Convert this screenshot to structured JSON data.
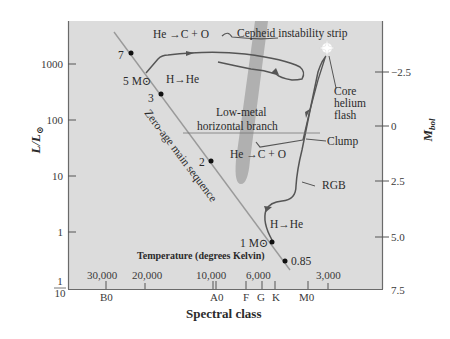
{
  "colors": {
    "plot_bg": "#dcdcdc",
    "frame": "#6a6a6a",
    "zams_line": "#9a9a9a",
    "track": "#555555",
    "cepheid_strip": "#a8a8a8",
    "dot": "#111111",
    "text": "#2b2b2b"
  },
  "left_axis": {
    "title_main": "L/L",
    "title_sub": "⊙",
    "ticks": [
      {
        "label": "1000",
        "y": 52
      },
      {
        "label": "100",
        "y": 106
      },
      {
        "label": "10",
        "y": 161
      },
      {
        "label": "1",
        "y": 215
      }
    ],
    "bottom_fraction": {
      "num": "1",
      "den": "10"
    }
  },
  "right_axis": {
    "title_main": "M",
    "title_sub": "bol",
    "ticks": [
      {
        "label": "−2.5",
        "y": 72
      },
      {
        "label": "0",
        "y": 125
      },
      {
        "label": "2.5",
        "y": 181
      },
      {
        "label": "5.0",
        "y": 236
      },
      {
        "label": "7.5",
        "y": 289
      }
    ]
  },
  "temperature_axis": {
    "title": "Temperature (degrees Kelvin)",
    "labels": [
      {
        "label": "30,000",
        "x": 112
      },
      {
        "label": "20,000",
        "x": 150
      },
      {
        "label": "10,000",
        "x": 222
      },
      {
        "label": "6,000",
        "x": 268
      },
      {
        "label": "3,000",
        "x": 328
      }
    ]
  },
  "spectral_axis": {
    "title": "Spectral class",
    "labels": [
      {
        "label": "B0",
        "x": 107
      },
      {
        "label": "A0",
        "x": 218
      },
      {
        "label": "F",
        "x": 246
      },
      {
        "label": "G",
        "x": 261
      },
      {
        "label": "K",
        "x": 276
      },
      {
        "label": "M0",
        "x": 306
      }
    ]
  },
  "annotations": {
    "zams": "Zero-age main sequence",
    "cepheid": "Cepheid instability strip",
    "he_burn_top": "He →C + O",
    "h_burn_top": "H→He",
    "low_metal_1": "Low-metal",
    "low_metal_2": "horizontal branch",
    "he_burn_mid": "He →C + O",
    "core_1": "Core",
    "core_2": "helium",
    "core_3": "flash",
    "clump": "Clump",
    "rgb": "RGB",
    "h_burn_low": "H→He"
  },
  "stars": [
    {
      "label": "7",
      "x": 131,
      "y": 53
    },
    {
      "label": "3",
      "x": 161,
      "y": 94
    },
    {
      "label": "2",
      "x": 211,
      "y": 161
    },
    {
      "label": "1 M⊙",
      "x": 272,
      "y": 242
    },
    {
      "label": "0.85",
      "x": 285,
      "y": 261
    }
  ],
  "mass_label_5": "5 M⊙"
}
